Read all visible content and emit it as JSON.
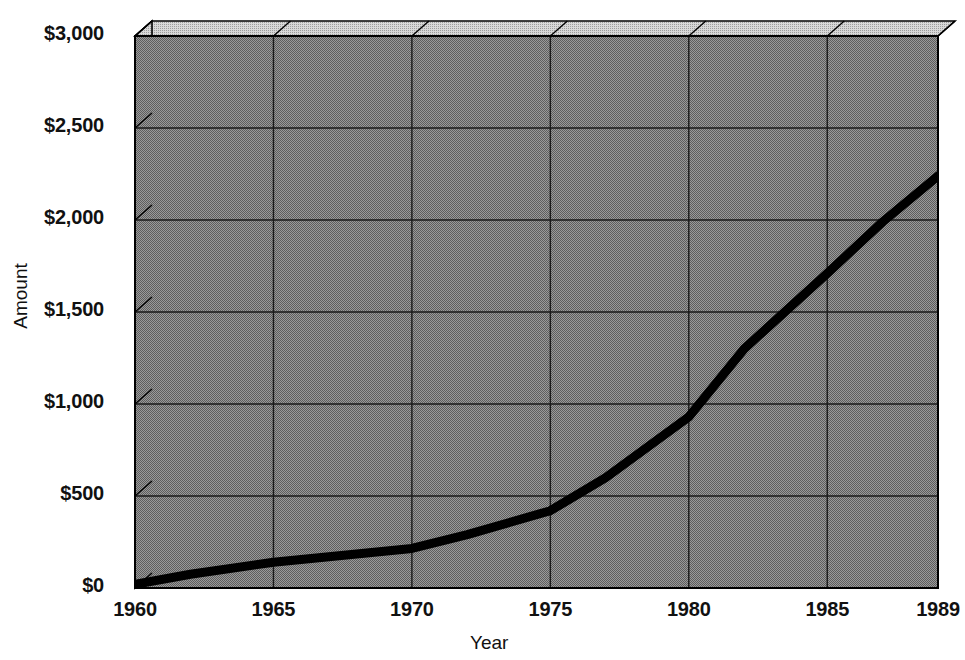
{
  "chart_data": {
    "type": "line",
    "title": "",
    "xlabel": "Year",
    "ylabel": "Amount",
    "xlim": [
      1960,
      1989
    ],
    "ylim": [
      0,
      3000
    ],
    "grid": true,
    "legend": false,
    "style": "3d-area-box",
    "y_ticks": [
      0,
      500,
      1000,
      1500,
      2000,
      2500,
      3000
    ],
    "y_tick_labels": [
      "$0",
      "$500",
      "$1,000",
      "$1,500",
      "$2,000",
      "$2,500",
      "$3,000"
    ],
    "x_ticks": [
      1960,
      1965,
      1970,
      1975,
      1980,
      1985,
      1989
    ],
    "x_tick_labels": [
      "1960",
      "1965",
      "1970",
      "1975",
      "1980",
      "1985",
      "1989"
    ],
    "series": [
      {
        "name": "Amount",
        "x": [
          1960,
          1962,
          1965,
          1968,
          1970,
          1972,
          1975,
          1977,
          1980,
          1982,
          1985,
          1987,
          1989
        ],
        "values": [
          20,
          75,
          140,
          185,
          215,
          290,
          420,
          600,
          930,
          1300,
          1710,
          1990,
          2240
        ]
      }
    ],
    "colors": {
      "line": "#000000",
      "plot_background": "#808080",
      "top_face": "#bfbfbf",
      "side_face": "#bfbfbf",
      "gridline": "#1a1a1a",
      "border": "#000000",
      "text": "#111111",
      "page_background": "#ffffff"
    }
  },
  "axes": {
    "y_title": "Amount",
    "x_title": "Year"
  }
}
